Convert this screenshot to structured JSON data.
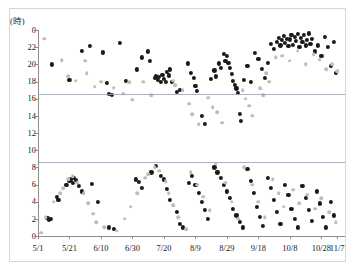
{
  "chart_data": {
    "type": "scatter",
    "title": "",
    "subtitle": "",
    "xlabel": "",
    "ylabel": "",
    "y_unit_label": "(時)",
    "grid": false,
    "legend_position": "none",
    "x_tick_labels": [
      "5/1",
      "5/21",
      "6/10",
      "6/30",
      "7/20",
      "8/9",
      "8/29",
      "9/18",
      "10/8",
      "10/28",
      "11/7"
    ],
    "x_tick_days": [
      0,
      20,
      40,
      60,
      80,
      100,
      120,
      140,
      160,
      180,
      190
    ],
    "xlim_days": [
      0,
      195
    ],
    "y_tick_labels": [
      "0",
      "22",
      "20",
      "18",
      "16",
      "14",
      "12",
      "10",
      "8",
      "6",
      "4",
      "2",
      "0"
    ],
    "y_tick_values": [
      24,
      22,
      20,
      18,
      16,
      14,
      12,
      10,
      8,
      6,
      4,
      2,
      0
    ],
    "ylim": [
      0,
      24
    ],
    "y_axis_direction": "inverted-clock",
    "reference_lines": [
      {
        "value": 16.5,
        "label": ""
      },
      {
        "value": 8.6,
        "label": ""
      }
    ],
    "series": [
      {
        "name": "series-dark",
        "color": "#1a1a1a",
        "marker": "circle",
        "points": [
          [
            9,
            20.0
          ],
          [
            20,
            18.2
          ],
          [
            28,
            21.6
          ],
          [
            33,
            22.1
          ],
          [
            41,
            21.4
          ],
          [
            44,
            17.8
          ],
          [
            45,
            16.6
          ],
          [
            47,
            16.4
          ],
          [
            52,
            22.5
          ],
          [
            56,
            18.1
          ],
          [
            63,
            19.4
          ],
          [
            66,
            20.8
          ],
          [
            70,
            21.5
          ],
          [
            71,
            20.4
          ],
          [
            74,
            18.4
          ],
          [
            75,
            18.6
          ],
          [
            76,
            18.2
          ],
          [
            77,
            18.5
          ],
          [
            78,
            18.0
          ],
          [
            79,
            18.8
          ],
          [
            80,
            18.3
          ],
          [
            81,
            18.0
          ],
          [
            82,
            19.1
          ],
          [
            83,
            18.7
          ],
          [
            84,
            19.4
          ],
          [
            85,
            18.0
          ],
          [
            88,
            16.8
          ],
          [
            90,
            17.0
          ],
          [
            95,
            20.1
          ],
          [
            97,
            19.0
          ],
          [
            99,
            18.4
          ],
          [
            100,
            17.5
          ],
          [
            101,
            16.9
          ],
          [
            104,
            14.0
          ],
          [
            106,
            13.1
          ],
          [
            110,
            18.3
          ],
          [
            112,
            19.3
          ],
          [
            113,
            18.6
          ],
          [
            115,
            20.1
          ],
          [
            116,
            19.6
          ],
          [
            118,
            21.2
          ],
          [
            119,
            20.4
          ],
          [
            120,
            21.0
          ],
          [
            121,
            20.2
          ],
          [
            122,
            19.6
          ],
          [
            123,
            18.9
          ],
          [
            124,
            18.1
          ],
          [
            125,
            17.6
          ],
          [
            126,
            17.2
          ],
          [
            127,
            16.7
          ],
          [
            128,
            14.2
          ],
          [
            129,
            13.4
          ],
          [
            131,
            18.2
          ],
          [
            133,
            19.8
          ],
          [
            135,
            18.0
          ],
          [
            138,
            21.3
          ],
          [
            140,
            20.6
          ],
          [
            142,
            19.5
          ],
          [
            144,
            18.4
          ],
          [
            146,
            20.2
          ],
          [
            148,
            22.4
          ],
          [
            150,
            21.8
          ],
          [
            152,
            22.6
          ],
          [
            153,
            23.1
          ],
          [
            154,
            22.2
          ],
          [
            155,
            22.8
          ],
          [
            156,
            23.3
          ],
          [
            157,
            22.5
          ],
          [
            158,
            23.0
          ],
          [
            159,
            22.1
          ],
          [
            160,
            22.9
          ],
          [
            161,
            23.4
          ],
          [
            162,
            22.3
          ],
          [
            163,
            23.2
          ],
          [
            164,
            22.7
          ],
          [
            165,
            23.5
          ],
          [
            166,
            22.0
          ],
          [
            167,
            23.1
          ],
          [
            168,
            22.6
          ],
          [
            169,
            23.4
          ],
          [
            170,
            22.2
          ],
          [
            171,
            22.8
          ],
          [
            172,
            23.6
          ],
          [
            173,
            22.4
          ],
          [
            174,
            23.0
          ],
          [
            176,
            21.5
          ],
          [
            178,
            22.2
          ],
          [
            180,
            21.0
          ],
          [
            182,
            23.2
          ],
          [
            184,
            22.0
          ],
          [
            186,
            19.8
          ],
          [
            188,
            22.6
          ],
          [
            189,
            19.0
          ],
          [
            6,
            2.1
          ],
          [
            7,
            1.9
          ],
          [
            8,
            2.0
          ],
          [
            12,
            4.6
          ],
          [
            13,
            4.2
          ],
          [
            18,
            6.0
          ],
          [
            20,
            6.4
          ],
          [
            21,
            6.6
          ],
          [
            22,
            6.2
          ],
          [
            23,
            6.8
          ],
          [
            24,
            6.5
          ],
          [
            26,
            5.8
          ],
          [
            28,
            5.2
          ],
          [
            34,
            6.1
          ],
          [
            38,
            4.0
          ],
          [
            45,
            1.0
          ],
          [
            48,
            0.8
          ],
          [
            62,
            6.6
          ],
          [
            64,
            6.3
          ],
          [
            66,
            5.6
          ],
          [
            72,
            7.4
          ],
          [
            75,
            8.2
          ],
          [
            78,
            7.0
          ],
          [
            80,
            6.6
          ],
          [
            82,
            5.5
          ],
          [
            84,
            4.2
          ],
          [
            88,
            2.8
          ],
          [
            90,
            1.4
          ],
          [
            92,
            1.0
          ],
          [
            96,
            6.2
          ],
          [
            98,
            7.0
          ],
          [
            100,
            6.0
          ],
          [
            102,
            5.0
          ],
          [
            104,
            4.0
          ],
          [
            106,
            3.0
          ],
          [
            108,
            2.0
          ],
          [
            112,
            8.0
          ],
          [
            114,
            7.4
          ],
          [
            116,
            6.8
          ],
          [
            118,
            6.0
          ],
          [
            120,
            5.2
          ],
          [
            122,
            4.4
          ],
          [
            124,
            3.2
          ],
          [
            126,
            2.4
          ],
          [
            128,
            1.6
          ],
          [
            130,
            1.0
          ],
          [
            133,
            7.8
          ],
          [
            135,
            6.4
          ],
          [
            137,
            5.0
          ],
          [
            139,
            3.4
          ],
          [
            141,
            2.2
          ],
          [
            143,
            1.2
          ],
          [
            146,
            6.8
          ],
          [
            148,
            5.6
          ],
          [
            150,
            4.2
          ],
          [
            152,
            2.8
          ],
          [
            154,
            1.4
          ],
          [
            157,
            6.0
          ],
          [
            159,
            4.8
          ],
          [
            161,
            3.2
          ],
          [
            163,
            2.0
          ],
          [
            165,
            1.0
          ],
          [
            168,
            5.8
          ],
          [
            170,
            4.4
          ],
          [
            172,
            3.0
          ],
          [
            174,
            1.8
          ],
          [
            177,
            5.2
          ],
          [
            179,
            3.8
          ],
          [
            181,
            2.2
          ],
          [
            183,
            1.0
          ],
          [
            186,
            4.0
          ],
          [
            188,
            2.4
          ]
        ]
      },
      {
        "name": "series-light",
        "color": "#bdbdbd",
        "marker": "circle",
        "points": [
          [
            4,
            23.0
          ],
          [
            15,
            20.5
          ],
          [
            19,
            18.6
          ],
          [
            24,
            18.1
          ],
          [
            30,
            20.4
          ],
          [
            31,
            19.0
          ],
          [
            36,
            17.4
          ],
          [
            40,
            18.0
          ],
          [
            48,
            17.3
          ],
          [
            54,
            16.6
          ],
          [
            58,
            17.9
          ],
          [
            60,
            15.9
          ],
          [
            67,
            18.0
          ],
          [
            72,
            16.4
          ],
          [
            86,
            18.1
          ],
          [
            87,
            17.6
          ],
          [
            92,
            17.0
          ],
          [
            96,
            15.4
          ],
          [
            98,
            14.2
          ],
          [
            102,
            13.0
          ],
          [
            108,
            16.1
          ],
          [
            111,
            15.0
          ],
          [
            114,
            14.4
          ],
          [
            117,
            13.2
          ],
          [
            130,
            17.0
          ],
          [
            132,
            16.0
          ],
          [
            134,
            15.2
          ],
          [
            136,
            14.0
          ],
          [
            141,
            17.2
          ],
          [
            143,
            16.4
          ],
          [
            145,
            19.0
          ],
          [
            147,
            18.0
          ],
          [
            151,
            20.8
          ],
          [
            155,
            21.0
          ],
          [
            160,
            20.4
          ],
          [
            165,
            21.6
          ],
          [
            170,
            20.0
          ],
          [
            175,
            21.2
          ],
          [
            179,
            20.6
          ],
          [
            183,
            19.4
          ],
          [
            187,
            20.0
          ],
          [
            190,
            19.2
          ],
          [
            2,
            0.4
          ],
          [
            5,
            2.2
          ],
          [
            10,
            4.0
          ],
          [
            14,
            5.0
          ],
          [
            16,
            5.6
          ],
          [
            19,
            6.6
          ],
          [
            22,
            7.0
          ],
          [
            25,
            6.2
          ],
          [
            29,
            5.0
          ],
          [
            32,
            3.8
          ],
          [
            35,
            2.6
          ],
          [
            37,
            1.6
          ],
          [
            42,
            1.0
          ],
          [
            50,
            0.6
          ],
          [
            55,
            2.0
          ],
          [
            59,
            3.4
          ],
          [
            63,
            5.0
          ],
          [
            68,
            6.8
          ],
          [
            70,
            7.2
          ],
          [
            74,
            8.0
          ],
          [
            77,
            7.6
          ],
          [
            81,
            6.4
          ],
          [
            83,
            5.0
          ],
          [
            86,
            3.6
          ],
          [
            89,
            2.2
          ],
          [
            94,
            0.8
          ],
          [
            97,
            7.4
          ],
          [
            101,
            6.0
          ],
          [
            105,
            4.6
          ],
          [
            109,
            3.0
          ],
          [
            113,
            8.4
          ],
          [
            119,
            6.2
          ],
          [
            123,
            4.0
          ],
          [
            127,
            2.0
          ],
          [
            131,
            8.0
          ],
          [
            136,
            6.0
          ],
          [
            140,
            4.0
          ],
          [
            144,
            2.2
          ],
          [
            149,
            6.6
          ],
          [
            153,
            5.0
          ],
          [
            156,
            3.4
          ],
          [
            162,
            5.4
          ],
          [
            166,
            3.8
          ],
          [
            171,
            4.8
          ],
          [
            176,
            3.2
          ],
          [
            180,
            4.4
          ],
          [
            185,
            2.8
          ],
          [
            189,
            1.6
          ]
        ]
      }
    ]
  }
}
